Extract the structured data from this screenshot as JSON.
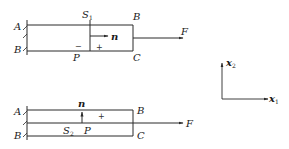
{
  "figure_top": {
    "labels": {
      "A": "A",
      "B_left": "B",
      "S": "S",
      "S_sub": "1",
      "B_right": "B",
      "n": "n",
      "F": "F",
      "P": "P",
      "C": "C",
      "minus": "−",
      "plus": "+"
    }
  },
  "figure_bottom": {
    "labels": {
      "A": "A",
      "B_left": "B",
      "n": "n",
      "plus": "+",
      "B_right": "B",
      "F": "F",
      "S": "S",
      "S_sub": "2",
      "P": "P",
      "C": "C"
    }
  },
  "axes": {
    "x1": "x",
    "x1_sub": "1",
    "x2": "x",
    "x2_sub": "2"
  },
  "colors": {
    "stroke": "#2a2a2a",
    "text": "#1a1a1a"
  }
}
